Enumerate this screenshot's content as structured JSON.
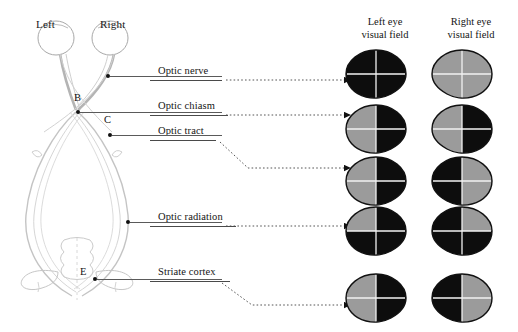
{
  "figure": {
    "type": "anatomical-diagram",
    "colors": {
      "seeing": "#9b9b9b",
      "blind": "#0d0d0d",
      "outline": "#111111",
      "crosshair": "#f2f2f2",
      "leader": "#4a4a4a",
      "tract": "#b9b9b9"
    }
  },
  "anatomy": {
    "eye_labels": [
      {
        "text": "Left",
        "x": 36,
        "y": 18
      },
      {
        "text": "Right",
        "x": 100,
        "y": 18
      }
    ],
    "point_labels": [
      {
        "text": "B",
        "x": 74,
        "y": 96
      },
      {
        "text": "C",
        "x": 104,
        "y": 118
      },
      {
        "text": "E",
        "x": 86,
        "y": 270
      }
    ]
  },
  "callouts": [
    {
      "id": "optic-nerve",
      "label": "Optic nerve",
      "text_x": 158,
      "text_y": 65,
      "underline_x": 150,
      "underline_y": 80,
      "underline_w": 72,
      "marker_x": 106,
      "marker_y": 74,
      "solid_x": 110,
      "solid_y": 76,
      "solid_w": 112,
      "path": "M226,80 L352,80",
      "arrow_x": 352,
      "arrow_y": 80
    },
    {
      "id": "optic-chiasm",
      "label": "Optic chiasm",
      "text_x": 158,
      "text_y": 100,
      "underline_x": 150,
      "underline_y": 115,
      "underline_w": 78,
      "marker_x": 76,
      "marker_y": 110,
      "solid_x": 80,
      "solid_y": 112,
      "solid_w": 142,
      "path": "M226,115 L352,115",
      "arrow_x": 352,
      "arrow_y": 115
    },
    {
      "id": "optic-tract",
      "label": "Optic tract",
      "text_x": 158,
      "text_y": 125,
      "underline_x": 150,
      "underline_y": 140,
      "underline_w": 66,
      "marker_x": 108,
      "marker_y": 133,
      "solid_x": 112,
      "solid_y": 135,
      "solid_w": 110,
      "path": "M220,142 L248,168 L352,168",
      "arrow_x": 352,
      "arrow_y": 168
    },
    {
      "id": "optic-radiation",
      "label": "Optic radiation",
      "text_x": 158,
      "text_y": 211,
      "underline_x": 150,
      "underline_y": 226,
      "underline_w": 86,
      "marker_x": 126,
      "marker_y": 220,
      "solid_x": 130,
      "solid_y": 222,
      "solid_w": 92,
      "path": "M226,226 L352,226",
      "arrow_x": 352,
      "arrow_y": 226
    },
    {
      "id": "striate-cortex",
      "label": "Striate cortex",
      "text_x": 158,
      "text_y": 266,
      "underline_x": 150,
      "underline_y": 281,
      "underline_w": 80,
      "marker_x": 93,
      "marker_y": 277,
      "solid_x": 97,
      "solid_y": 279,
      "solid_w": 125,
      "path": "M222,283 L252,305 L352,305",
      "arrow_x": 352,
      "arrow_y": 305
    }
  ],
  "fields": {
    "headers": [
      {
        "line1": "Left eye",
        "line2": "visual field",
        "x": 14
      },
      {
        "line1": "Right eye",
        "line2": "visual field",
        "x": 100
      }
    ],
    "rows": [
      {
        "lesion": "optic-nerve",
        "y": 48,
        "left": {
          "eye": "left",
          "quadrants": {
            "upper_left": "blind",
            "lower_left": "blind",
            "upper_right": "blind",
            "lower_right": "blind"
          },
          "summary": "total loss"
        },
        "right": {
          "eye": "right",
          "quadrants": {
            "upper_left": "seeing",
            "lower_left": "seeing",
            "upper_right": "seeing",
            "lower_right": "seeing"
          },
          "summary": "normal"
        }
      },
      {
        "lesion": "optic-chiasm",
        "y": 103,
        "left": {
          "eye": "left",
          "quadrants": {
            "upper_left": "seeing",
            "lower_left": "seeing",
            "upper_right": "blind",
            "lower_right": "blind"
          },
          "summary": "temporal hemianopia"
        },
        "right": {
          "eye": "right",
          "quadrants": {
            "upper_left": "blind",
            "lower_left": "blind",
            "upper_right": "seeing",
            "lower_right": "seeing"
          },
          "summary": "temporal hemianopia"
        }
      },
      {
        "lesion": "optic-tract",
        "y": 155,
        "left": {
          "eye": "left",
          "quadrants": {
            "upper_left": "seeing",
            "lower_left": "seeing",
            "upper_right": "blind",
            "lower_right": "blind"
          },
          "summary": "homonymous hemianopia"
        },
        "right": {
          "eye": "right",
          "quadrants": {
            "upper_left": "seeing",
            "lower_left": "seeing",
            "upper_right": "blind",
            "lower_right": "blind"
          },
          "summary": "homonymous hemianopia"
        }
      },
      {
        "lesion": "optic-radiation",
        "y": 205,
        "left": {
          "eye": "left",
          "quadrants": {
            "upper_left": "seeing",
            "lower_left": "blind",
            "upper_right": "blind",
            "lower_right": "blind"
          },
          "summary": "upper quadrantanopia"
        },
        "right": {
          "eye": "right",
          "quadrants": {
            "upper_left": "seeing",
            "lower_left": "blind",
            "upper_right": "blind",
            "lower_right": "blind"
          },
          "summary": "upper quadrantanopia"
        }
      },
      {
        "lesion": "striate-cortex",
        "y": 272,
        "left": {
          "eye": "left",
          "quadrants": {
            "upper_left": "seeing",
            "lower_left": "seeing",
            "upper_right": "blind",
            "lower_right": "blind"
          },
          "summary": "hemianopia with macular sparing",
          "macular_sparing": true
        },
        "right": {
          "eye": "right",
          "quadrants": {
            "upper_left": "seeing",
            "lower_left": "seeing",
            "upper_right": "blind",
            "lower_right": "blind"
          },
          "summary": "hemianopia with macular sparing",
          "macular_sparing": true
        }
      }
    ]
  }
}
